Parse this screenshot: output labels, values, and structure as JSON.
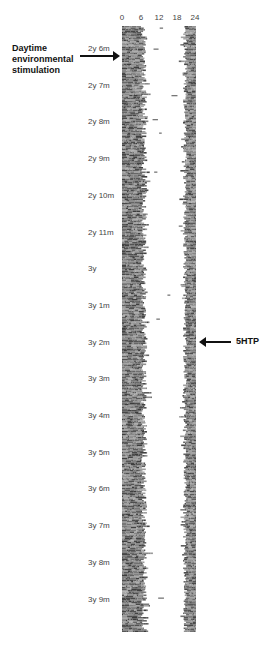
{
  "chart_data": {
    "type": "heatmap",
    "subtype": "actogram",
    "title": "",
    "xlabel": "Hour of day",
    "ylabel": "Age",
    "x_ticks": [
      "0",
      "6",
      "12",
      "18",
      "24"
    ],
    "xlim": [
      0,
      24
    ],
    "y_ticks": [
      "2y 6m",
      "2y 7m",
      "2y 8m",
      "2y 9m",
      "2y 10m",
      "2y 11m",
      "3y",
      "3y 1m",
      "3y 2m",
      "3y 3m",
      "3y 4m",
      "3y 5m",
      "3y 6m",
      "3y 7m",
      "3y 8m",
      "3y 9m"
    ],
    "ylim": [
      "2y 6m",
      "3y 10m"
    ],
    "grid": false,
    "activity_bands": [
      {
        "name": "morning activity band",
        "start_hour": 0,
        "end_hour_approx": 6.5,
        "end_hour_range": [
          5,
          8.5
        ]
      },
      {
        "name": "evening activity band",
        "start_hour_approx": 19.5,
        "start_hour_range": [
          18.5,
          20.5
        ],
        "end_hour": 24
      }
    ],
    "midday_activity": "sparse scattered short bouts between ~7h and ~19h, more frequent in first months (2y 6m to 3y 2m), nearly absent after 3y 3m",
    "annotations": [
      {
        "text": "Daytime environmental stimulation",
        "at": "2y 6m",
        "side": "left",
        "arrow": "right"
      },
      {
        "text": "5HTP",
        "at": "3y 2m",
        "side": "right",
        "arrow": "left"
      }
    ]
  },
  "x_axis": {
    "ticks": [
      "0",
      "6",
      "12",
      "18",
      "24"
    ]
  },
  "y_axis": {
    "labels": [
      "2y 6m",
      "2y 7m",
      "2y 8m",
      "2y 9m",
      "2y 10m",
      "2y 11m",
      "3y",
      "3y 1m",
      "3y 2m",
      "3y 3m",
      "3y 4m",
      "3y 5m",
      "3y 6m",
      "3y 7m",
      "3y 8m",
      "3y 9m"
    ]
  },
  "annotations": {
    "left_line1": "Daytime",
    "left_line2": "environmental",
    "left_line3": "stimulation",
    "right": "5HTP"
  },
  "colors": {
    "activity": "#5a5a5a",
    "background": "#ffffff",
    "text": "#111111"
  }
}
